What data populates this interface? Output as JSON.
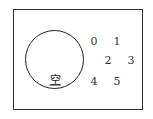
{
  "diagram": {
    "type": "venn",
    "set_label": "空",
    "elements_outside": [
      {
        "label": "0",
        "x": 94,
        "y": 41
      },
      {
        "label": "1",
        "x": 117,
        "y": 41
      },
      {
        "label": "2",
        "x": 108,
        "y": 60
      },
      {
        "label": "3",
        "x": 131,
        "y": 60
      },
      {
        "label": "4",
        "x": 94,
        "y": 81
      },
      {
        "label": "5",
        "x": 117,
        "y": 81
      }
    ]
  }
}
